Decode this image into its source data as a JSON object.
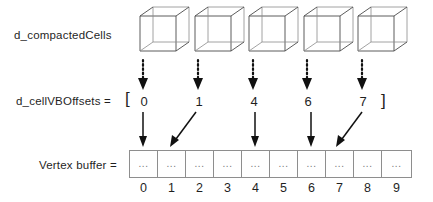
{
  "diagram": {
    "title_row_label": "d_compactedCells",
    "offsets_row_label": "d_cellVBOffsets  =",
    "buffer_row_label": "Vertex buffer  =",
    "bracket_open": "[",
    "bracket_close": "]",
    "cell_placeholder": "...",
    "cube_count": 5,
    "cubes": [
      {
        "name": "cube-0"
      },
      {
        "name": "cube-1"
      },
      {
        "name": "cube-2"
      },
      {
        "name": "cube-3"
      },
      {
        "name": "cube-4"
      }
    ],
    "offsets": [
      "0",
      "1",
      "4",
      "6",
      "7"
    ],
    "buffer_cells": [
      {
        "index": "0",
        "value": "..."
      },
      {
        "index": "1",
        "value": "..."
      },
      {
        "index": "2",
        "value": "..."
      },
      {
        "index": "3",
        "value": "..."
      },
      {
        "index": "4",
        "value": "..."
      },
      {
        "index": "5",
        "value": "..."
      },
      {
        "index": "6",
        "value": "..."
      },
      {
        "index": "7",
        "value": "..."
      },
      {
        "index": "8",
        "value": "..."
      },
      {
        "index": "9",
        "value": "..."
      }
    ],
    "colors": {
      "stroke": "#111111",
      "cube_stroke": "#4a4a4a",
      "cell_border": "#8e8e8e",
      "text": "#1f1f1f",
      "dots": "#777777",
      "background": "#ffffff"
    }
  }
}
